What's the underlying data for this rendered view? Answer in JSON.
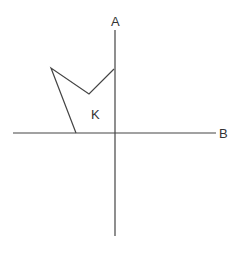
{
  "diagram": {
    "axes": {
      "vertical": {
        "label": "A",
        "x": 115,
        "y1": 30,
        "y2": 236
      },
      "horizontal": {
        "label": "B",
        "y": 133,
        "x1": 13,
        "x2": 216
      }
    },
    "shape": {
      "label": "K",
      "vertices": [
        [
          51,
          68
        ],
        [
          89,
          94
        ],
        [
          114,
          69
        ],
        [
          114,
          133
        ],
        [
          76,
          133
        ]
      ]
    },
    "stroke_color": "#444444",
    "label_color": "#333333"
  }
}
